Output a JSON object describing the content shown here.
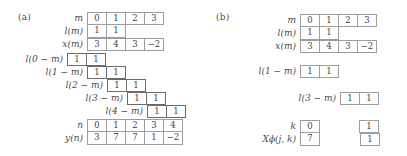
{
  "figure": {
    "panel_a_tag": "(a)",
    "panel_b_tag": "(b)"
  },
  "panel_a": {
    "labels": {
      "m": "m",
      "l_m": "l(m)",
      "x_m": "x(m)",
      "l0": "l(0 − m)",
      "l1": "l(1 − m)",
      "l2": "l(2 − m)",
      "l3": "l(3 − m)",
      "l4": "l(4 − m)",
      "n": "n",
      "y_n": "y(n)"
    },
    "m_row": [
      "0",
      "1",
      "2",
      "3"
    ],
    "l_row": [
      "1",
      "1"
    ],
    "x_row": [
      "3",
      "4",
      "3",
      "−2"
    ],
    "shifted": [
      {
        "label_key": "l0",
        "offset": -1,
        "values": [
          "1",
          "1"
        ]
      },
      {
        "label_key": "l1",
        "offset": 0,
        "values": [
          "1",
          "1"
        ]
      },
      {
        "label_key": "l2",
        "offset": 1,
        "values": [
          "1",
          "1"
        ]
      },
      {
        "label_key": "l3",
        "offset": 2,
        "values": [
          "1",
          "1"
        ]
      },
      {
        "label_key": "l4",
        "offset": 3,
        "values": [
          "1",
          "1"
        ]
      }
    ],
    "n_row": [
      "0",
      "1",
      "2",
      "3",
      "4"
    ],
    "y_row": [
      "3",
      "7",
      "7",
      "1",
      "−2"
    ]
  },
  "panel_b": {
    "labels": {
      "m": "m",
      "l_m": "l(m)",
      "x_m": "x(m)",
      "l1": "l(1 − m)",
      "l3": "l(3 − m)",
      "k": "k",
      "X_jk": "Xϕ(j, k)"
    },
    "m_row": [
      "0",
      "1",
      "2",
      "3"
    ],
    "l_row": [
      "1",
      "1"
    ],
    "x_row": [
      "3",
      "4",
      "3",
      "−2"
    ],
    "l1_values": [
      "1",
      "1"
    ],
    "l3_values": [
      "1",
      "1"
    ],
    "k_values": [
      "0",
      "1"
    ],
    "X_values": [
      "7",
      "1"
    ]
  },
  "colors": {
    "cell_border": "#9d9d9d",
    "cell_border_highlight": "#6b6b6b",
    "text": "#3f3f3f",
    "background": "#ffffff"
  }
}
